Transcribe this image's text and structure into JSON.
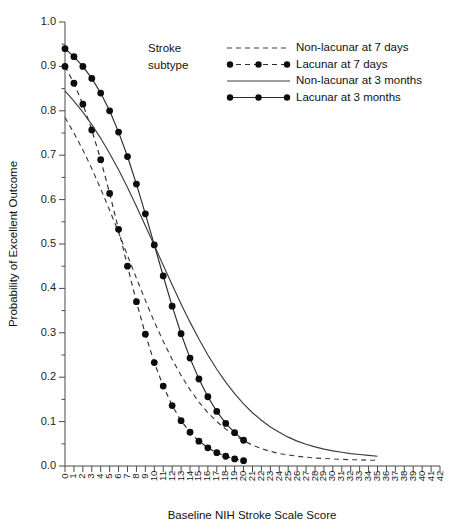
{
  "chart_data": {
    "type": "line",
    "title": "",
    "xlabel": "Baseline NIH Stroke Scale Score",
    "ylabel": "Probability of Excellent Outcome",
    "xlim": [
      0,
      42
    ],
    "ylim": [
      0.0,
      1.0
    ],
    "grid": false,
    "legend_position": "top-center",
    "legend_title": [
      "Stroke",
      "subtype"
    ],
    "x_ticks": [
      0,
      1,
      2,
      3,
      4,
      5,
      6,
      7,
      8,
      9,
      10,
      11,
      12,
      13,
      14,
      15,
      16,
      17,
      18,
      19,
      20,
      21,
      22,
      23,
      24,
      25,
      26,
      27,
      28,
      29,
      30,
      31,
      32,
      33,
      34,
      35,
      36,
      37,
      38,
      39,
      40,
      41,
      42
    ],
    "y_ticks": [
      "0.0",
      "0.1",
      "0.2",
      "0.3",
      "0.4",
      "0.5",
      "0.6",
      "0.7",
      "0.8",
      "0.9",
      "1.0"
    ],
    "y_minor_ticks": [
      0.05,
      0.15,
      0.25,
      0.35,
      0.45,
      0.55,
      0.65,
      0.75,
      0.85,
      0.95
    ],
    "series": [
      {
        "name": "Non-lacunar at 7 days",
        "style": "dashed",
        "markers": false,
        "color": "#3c3c3c",
        "x": [
          0,
          1,
          2,
          3,
          4,
          5,
          6,
          7,
          8,
          9,
          10,
          11,
          12,
          13,
          14,
          15,
          16,
          17,
          18,
          19,
          20,
          21,
          22,
          23,
          24,
          25,
          26,
          27,
          28,
          29,
          30,
          31,
          32,
          33,
          34,
          35
        ],
        "y": [
          0.785,
          0.75,
          0.712,
          0.67,
          0.624,
          0.576,
          0.526,
          0.474,
          0.423,
          0.373,
          0.325,
          0.281,
          0.24,
          0.204,
          0.172,
          0.144,
          0.12,
          0.1,
          0.083,
          0.069,
          0.057,
          0.047,
          0.039,
          0.033,
          0.028,
          0.025,
          0.022,
          0.02,
          0.018,
          0.017,
          0.016,
          0.015,
          0.014,
          0.014,
          0.013,
          0.013
        ]
      },
      {
        "name": "Lacunar at 7 days",
        "style": "dashed",
        "markers": true,
        "color": "#2b2b2b",
        "x": [
          0,
          1,
          2,
          3,
          4,
          5,
          6,
          7,
          8,
          9,
          10,
          11,
          12,
          13,
          14,
          15,
          16,
          17,
          18,
          19,
          20
        ],
        "y": [
          0.9,
          0.862,
          0.815,
          0.757,
          0.69,
          0.614,
          0.533,
          0.45,
          0.37,
          0.297,
          0.233,
          0.18,
          0.136,
          0.102,
          0.076,
          0.056,
          0.041,
          0.03,
          0.022,
          0.016,
          0.012
        ]
      },
      {
        "name": "Non-lacunar at 3 months",
        "style": "solid",
        "markers": false,
        "color": "#3c3c3c",
        "x": [
          0,
          1,
          2,
          3,
          4,
          5,
          6,
          7,
          8,
          9,
          10,
          11,
          12,
          13,
          14,
          15,
          16,
          17,
          18,
          19,
          20,
          21,
          22,
          23,
          24,
          25,
          26,
          27,
          28,
          29,
          30,
          31,
          32,
          33,
          34,
          35
        ],
        "y": [
          0.845,
          0.822,
          0.797,
          0.769,
          0.738,
          0.704,
          0.667,
          0.627,
          0.585,
          0.541,
          0.497,
          0.452,
          0.408,
          0.365,
          0.324,
          0.286,
          0.25,
          0.218,
          0.189,
          0.163,
          0.14,
          0.12,
          0.103,
          0.088,
          0.076,
          0.065,
          0.056,
          0.049,
          0.043,
          0.038,
          0.034,
          0.031,
          0.028,
          0.026,
          0.024,
          0.022
        ]
      },
      {
        "name": "Lacunar at 3 months",
        "style": "solid",
        "markers": true,
        "color": "#2b2b2b",
        "x": [
          0,
          1,
          2,
          3,
          4,
          5,
          6,
          7,
          8,
          9,
          10,
          11,
          12,
          13,
          14,
          15,
          16,
          17,
          18,
          19,
          20
        ],
        "y": [
          0.94,
          0.922,
          0.9,
          0.873,
          0.84,
          0.8,
          0.752,
          0.697,
          0.635,
          0.568,
          0.498,
          0.428,
          0.36,
          0.298,
          0.243,
          0.196,
          0.156,
          0.123,
          0.096,
          0.075,
          0.058
        ]
      }
    ]
  },
  "legend": {
    "title_line1": "Stroke",
    "title_line2": "subtype",
    "items": [
      {
        "label": "Non-lacunar at 7 days",
        "style": "dashed",
        "markers": false
      },
      {
        "label": "Lacunar at 7 days",
        "style": "dashed",
        "markers": true
      },
      {
        "label": "Non-lacunar at 3 months",
        "style": "solid",
        "markers": false
      },
      {
        "label": "Lacunar at 3 months",
        "style": "solid",
        "markers": true
      }
    ]
  }
}
